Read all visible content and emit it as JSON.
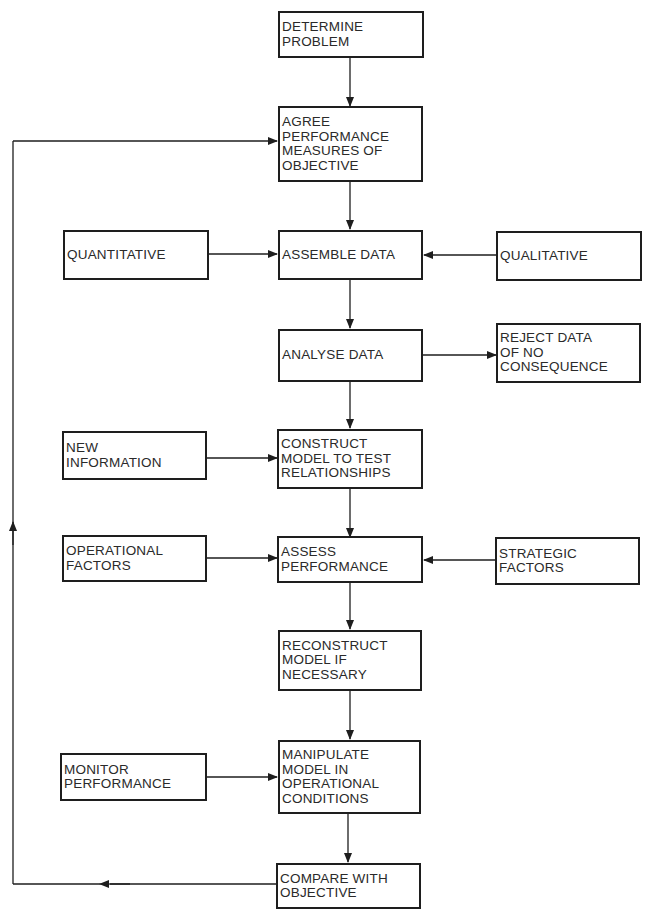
{
  "diagram": {
    "type": "flowchart",
    "nodes": {
      "determine_problem": {
        "lines": [
          "DETERMINE",
          "PROBLEM"
        ]
      },
      "agree_performance": {
        "lines": [
          "AGREE",
          "PERFORMANCE",
          "MEASURES OF",
          "OBJECTIVE"
        ]
      },
      "quantitative": {
        "lines": [
          "QUANTITATIVE"
        ]
      },
      "assemble_data": {
        "lines": [
          "ASSEMBLE DATA"
        ]
      },
      "qualitative": {
        "lines": [
          "QUALITATIVE"
        ]
      },
      "analyse_data": {
        "lines": [
          "ANALYSE DATA"
        ]
      },
      "reject_data": {
        "lines": [
          "REJECT DATA",
          "OF NO",
          "CONSEQUENCE"
        ]
      },
      "new_information": {
        "lines": [
          "NEW",
          "INFORMATION"
        ]
      },
      "construct_model": {
        "lines": [
          "CONSTRUCT",
          "MODEL TO TEST",
          "RELATIONSHIPS"
        ]
      },
      "operational_factors": {
        "lines": [
          "OPERATIONAL",
          "FACTORS"
        ]
      },
      "assess_performance": {
        "lines": [
          "ASSESS",
          "PERFORMANCE"
        ]
      },
      "strategic_factors": {
        "lines": [
          "STRATEGIC",
          "FACTORS"
        ]
      },
      "reconstruct_model": {
        "lines": [
          "RECONSTRUCT",
          "MODEL IF",
          "NECESSARY"
        ]
      },
      "monitor_performance": {
        "lines": [
          "MONITOR",
          "PERFORMANCE"
        ]
      },
      "manipulate_model": {
        "lines": [
          "MANIPULATE",
          "MODEL IN",
          "OPERATIONAL",
          "CONDITIONS"
        ]
      },
      "compare_objective": {
        "lines": [
          "COMPARE WITH",
          "OBJECTIVE"
        ]
      }
    },
    "edges": [
      {
        "from": "determine_problem",
        "to": "agree_performance"
      },
      {
        "from": "agree_performance",
        "to": "assemble_data"
      },
      {
        "from": "quantitative",
        "to": "assemble_data"
      },
      {
        "from": "qualitative",
        "to": "assemble_data"
      },
      {
        "from": "assemble_data",
        "to": "analyse_data"
      },
      {
        "from": "analyse_data",
        "to": "reject_data"
      },
      {
        "from": "analyse_data",
        "to": "construct_model"
      },
      {
        "from": "new_information",
        "to": "construct_model"
      },
      {
        "from": "construct_model",
        "to": "assess_performance"
      },
      {
        "from": "operational_factors",
        "to": "assess_performance"
      },
      {
        "from": "strategic_factors",
        "to": "assess_performance"
      },
      {
        "from": "assess_performance",
        "to": "reconstruct_model"
      },
      {
        "from": "reconstruct_model",
        "to": "manipulate_model"
      },
      {
        "from": "monitor_performance",
        "to": "manipulate_model"
      },
      {
        "from": "manipulate_model",
        "to": "compare_objective"
      },
      {
        "from": "compare_objective",
        "to": "agree_performance",
        "route": "feedback-loop-left"
      }
    ],
    "colors": {
      "line": "#1e1e1e",
      "text": "#2a2a2a",
      "background": "#ffffff"
    }
  }
}
